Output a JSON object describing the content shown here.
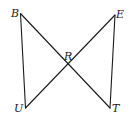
{
  "diagram": {
    "type": "geometry",
    "points": {
      "B": {
        "label": "B",
        "x": 20.5,
        "y": 13.5
      },
      "E": {
        "label": "E",
        "x": 115,
        "y": 15
      },
      "U": {
        "label": "U",
        "x": 25.5,
        "y": 108
      },
      "T": {
        "label": "T",
        "x": 110,
        "y": 108
      },
      "R": {
        "label": "R",
        "x": 68,
        "y": 65
      }
    },
    "segments": [
      {
        "name": "BU",
        "from": "B",
        "to": "U"
      },
      {
        "name": "BT",
        "from": "B",
        "to": "T"
      },
      {
        "name": "UE",
        "from": "U",
        "to": "E"
      },
      {
        "name": "ET",
        "from": "E",
        "to": "T"
      }
    ],
    "stroke_color": "#1a1a1a",
    "background": "#ffffff"
  }
}
